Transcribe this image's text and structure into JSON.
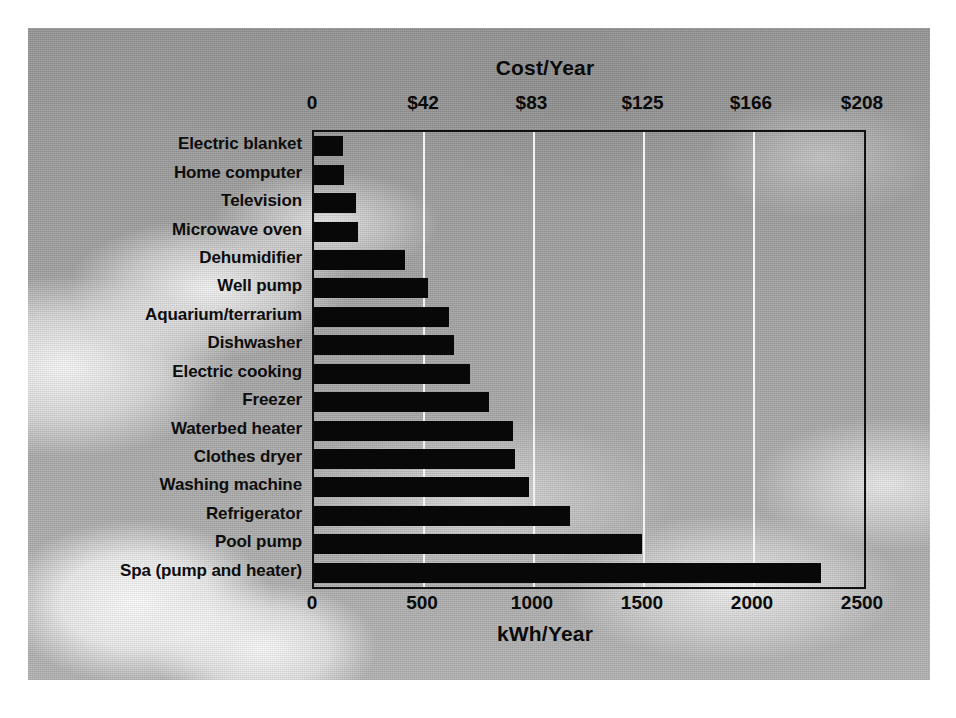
{
  "chart_data": {
    "type": "bar",
    "orientation": "horizontal",
    "title": "",
    "top_axis": {
      "label": "Cost/Year",
      "ticks": [
        "0",
        "$42",
        "$83",
        "$125",
        "$166",
        "$208"
      ],
      "tick_values": [
        0,
        42,
        83,
        125,
        166,
        208
      ],
      "range": [
        0,
        208
      ]
    },
    "bottom_axis": {
      "label": "kWh/Year",
      "ticks": [
        "0",
        "500",
        "1000",
        "1500",
        "2000",
        "2500"
      ],
      "tick_values": [
        0,
        500,
        1000,
        1500,
        2000,
        2500
      ],
      "range": [
        0,
        2500
      ]
    },
    "xlabel": "kWh/Year",
    "ylabel": "",
    "xlim": [
      0,
      2500
    ],
    "grid": true,
    "legend": null,
    "categories": [
      "Electric blanket",
      "Home computer",
      "Television",
      "Microwave oven",
      "Dehumidifier",
      "Well pump",
      "Aquarium/terrarium",
      "Dishwasher",
      "Electric cooking",
      "Freezer",
      "Waterbed heater",
      "Clothes dryer",
      "Washing machine",
      "Refrigerator",
      "Pool pump",
      "Spa (pump and heater)"
    ],
    "values": [
      130,
      135,
      190,
      200,
      415,
      520,
      615,
      635,
      710,
      795,
      905,
      915,
      975,
      1165,
      1490,
      2305
    ],
    "value_unit": "kWh/Year",
    "bar_color": "#080808"
  },
  "style": {
    "background_color": "#9c9c9c",
    "page_color": "#ffffff",
    "frame_color": "#111111",
    "gridline_color": "#f2f2f2",
    "text_color": "#0a0a0a"
  }
}
